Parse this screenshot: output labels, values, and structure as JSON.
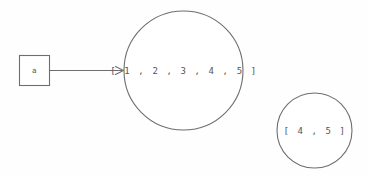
{
  "diagram": {
    "background_color": "#fefefe",
    "stroke_color": "#6e6e6e",
    "text_color": "#555555",
    "variable_box": {
      "label": "a",
      "x": 19,
      "y": 55,
      "width": 31,
      "height": 31
    },
    "objects": [
      {
        "name": "list-object-full",
        "label": "[ 1 , 2 , 3 , 4 , 5 ]",
        "cx": 183.5,
        "cy": 70.5,
        "r": 59.5
      },
      {
        "name": "list-object-slice",
        "label": "[ 4 , 5 ]",
        "cx": 314.5,
        "cy": 130.5,
        "r": 37.5
      }
    ],
    "edges": [
      {
        "name": "a-to-list",
        "from": "variable-box",
        "to": "list-object-full",
        "x1": 50,
        "y1": 70.5,
        "x2": 123,
        "y2": 70.5
      }
    ]
  }
}
